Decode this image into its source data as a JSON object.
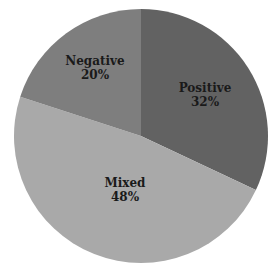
{
  "chart_data": {
    "type": "pie",
    "title": "",
    "start_angle_deg": 0,
    "direction": "clockwise",
    "slices": [
      {
        "label": "Positive",
        "value": 32,
        "pct_label": "32%",
        "color": "#626262"
      },
      {
        "label": "Mixed",
        "value": 48,
        "pct_label": "48%",
        "color": "#a9a9a9"
      },
      {
        "label": "Negative",
        "value": 20,
        "pct_label": "20%",
        "color": "#7e7e7e"
      }
    ],
    "legend": "none",
    "labels_inside": true
  }
}
